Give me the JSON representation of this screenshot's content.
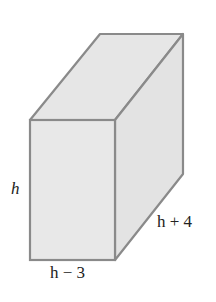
{
  "figure": {
    "type": "rectangular prism",
    "fill_color": "#e6e6e6",
    "edge_color": "#8a8a8a",
    "labels": {
      "height": "h",
      "width": "h − 3",
      "depth": "h + 4"
    }
  }
}
